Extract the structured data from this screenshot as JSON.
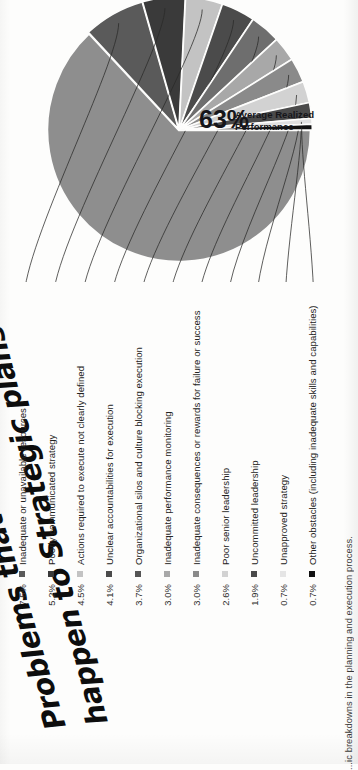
{
  "annotation": {
    "handwritten_line1": "Problems that",
    "handwritten_line2": "happen to Strategic plans"
  },
  "caption": {
    "text": "...ic breakdowns in the planning and execution process."
  },
  "chart_data": {
    "type": "pie",
    "title": "Problems that happen to Strategic plans",
    "center_value": "63%",
    "center_label_line1": "Average Realized",
    "center_label_line2": "Performance",
    "legend_position": "left",
    "categories": [
      "Average Realized Performance",
      "Inadequate or unavailable resources",
      "Poorly communicated strategy",
      "Actions required to execute not clearly defined",
      "Unclear accountabilities for execution",
      "Organizational silos and culture blocking execution",
      "Inadequate performance monitoring",
      "Inadequate consequences or rewards for failure or success",
      "Poor senior leadership",
      "Uncommitted leadership",
      "Unapproved strategy",
      "Other obstacles (including inadequate skills and capabilities)"
    ],
    "values": [
      63.0,
      7.5,
      5.2,
      4.5,
      4.1,
      3.7,
      3.0,
      3.0,
      2.6,
      1.9,
      0.7,
      0.7
    ],
    "value_labels": [
      "63%",
      "7.5%",
      "5.2%",
      "4.5%",
      "4.1%",
      "3.7%",
      "3.0%",
      "3.0%",
      "2.6%",
      "1.9%",
      "0.7%",
      "0.7%"
    ],
    "colors": [
      "#8e8e8e",
      "#5a5a5a",
      "#3a3a3a",
      "#c3c3c3",
      "#4b4b4b",
      "#6e6e6e",
      "#a8a8a8",
      "#8a8a8a",
      "#d2d2d2",
      "#4a4a4a",
      "#e0e0e0",
      "#111111"
    ]
  },
  "legend": {
    "items": [
      {
        "pct": "7.5%",
        "label": "Inadequate or unavailable resources",
        "color": "#5a5a5a"
      },
      {
        "pct": "5.2%",
        "label": "Poorly communicated strategy",
        "color": "#3a3a3a"
      },
      {
        "pct": "4.5%",
        "label": "Actions required to execute not clearly defined",
        "color": "#c3c3c3"
      },
      {
        "pct": "4.1%",
        "label": "Unclear accountabilities for execution",
        "color": "#4b4b4b"
      },
      {
        "pct": "3.7%",
        "label": "Organizational silos and culture blocking execution",
        "color": "#555555"
      },
      {
        "pct": "3.0%",
        "label": "Inadequate performance monitoring",
        "color": "#a8a8a8"
      },
      {
        "pct": "3.0%",
        "label": "Inadequate consequences or rewards for failure or success",
        "color": "#8a8a8a"
      },
      {
        "pct": "2.6%",
        "label": "Poor senior leadership",
        "color": "#d2d2d2"
      },
      {
        "pct": "1.9%",
        "label": "Uncommitted leadership",
        "color": "#4a4a4a"
      },
      {
        "pct": "0.7%",
        "label": "Unapproved strategy",
        "color": "#e5e5e5"
      },
      {
        "pct": "0.7%",
        "label": "Other obstacles (including inadequate skills and capabilities)",
        "color": "#111111"
      }
    ]
  }
}
